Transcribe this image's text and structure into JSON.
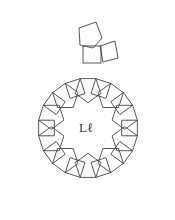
{
  "diagram": {
    "type": "tiling-ring",
    "center_label": "Lℓ",
    "stroke_color": "#444444",
    "background": "#ffffff"
  }
}
